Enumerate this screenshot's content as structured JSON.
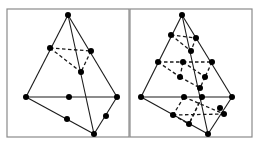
{
  "figure": {
    "colors": {
      "line": "#1a1a1a",
      "node": "#000000",
      "frame": "#8a8a8a",
      "background": "#ffffff"
    },
    "panels": [
      {
        "name": "quadratic-tetrahedron",
        "frame": {
          "x": 7,
          "y": 9,
          "w": 122,
          "h": 128
        },
        "solid_edges": [
          [
            68,
            15,
            26,
            97
          ],
          [
            68,
            15,
            117,
            97
          ],
          [
            68,
            15,
            94,
            134
          ],
          [
            26,
            97,
            117,
            97
          ],
          [
            26,
            97,
            94,
            134
          ],
          [
            117,
            97,
            94,
            134
          ]
        ],
        "dashed_edges": [
          [
            50,
            48,
            91,
            51
          ],
          [
            50,
            48,
            81,
            72
          ],
          [
            91,
            51,
            81,
            72
          ]
        ],
        "nodes": [
          [
            68,
            15
          ],
          [
            26,
            97
          ],
          [
            117,
            97
          ],
          [
            94,
            134
          ],
          [
            50,
            48
          ],
          [
            91,
            51
          ],
          [
            81,
            72
          ],
          [
            69,
            97
          ],
          [
            67,
            119
          ],
          [
            106,
            116
          ]
        ]
      },
      {
        "name": "cubic-tetrahedron",
        "frame": {
          "x": 130,
          "y": 9,
          "w": 122,
          "h": 128
        },
        "solid_edges": [
          [
            182,
            15,
            141,
            97
          ],
          [
            182,
            15,
            232,
            97
          ],
          [
            182,
            15,
            208,
            134
          ],
          [
            141,
            97,
            232,
            97
          ],
          [
            141,
            97,
            208,
            134
          ],
          [
            232,
            97,
            208,
            134
          ]
        ],
        "dashed_edges": [
          [
            171,
            35,
            196,
            38
          ],
          [
            171,
            35,
            191,
            51
          ],
          [
            196,
            38,
            191,
            51
          ],
          [
            158,
            62,
            183,
            62
          ],
          [
            183,
            62,
            212,
            62
          ],
          [
            158,
            62,
            180,
            77
          ],
          [
            183,
            62,
            180,
            77
          ],
          [
            183,
            62,
            205,
            77
          ],
          [
            212,
            62,
            205,
            77
          ],
          [
            180,
            77,
            200,
            88
          ],
          [
            205,
            77,
            200,
            88
          ],
          [
            184,
            97,
            173,
            115
          ],
          [
            202,
            97,
            189,
            124
          ],
          [
            184,
            97,
            224,
            114
          ],
          [
            173,
            115,
            224,
            114
          ],
          [
            202,
            97,
            189,
            124
          ],
          [
            173,
            115,
            189,
            124
          ]
        ],
        "nodes": [
          [
            182,
            15
          ],
          [
            141,
            97
          ],
          [
            232,
            97
          ],
          [
            208,
            134
          ],
          [
            171,
            35
          ],
          [
            196,
            38
          ],
          [
            191,
            51
          ],
          [
            158,
            62
          ],
          [
            183,
            62
          ],
          [
            212,
            62
          ],
          [
            180,
            77
          ],
          [
            205,
            77
          ],
          [
            200,
            88
          ],
          [
            184,
            97
          ],
          [
            202,
            97
          ],
          [
            173,
            115
          ],
          [
            189,
            124
          ],
          [
            224,
            114
          ],
          [
            220,
            108
          ]
        ]
      }
    ]
  }
}
